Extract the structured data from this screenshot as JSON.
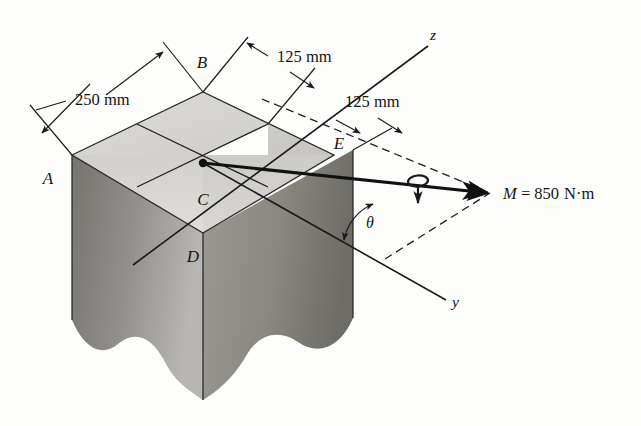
{
  "figure": {
    "type": "engineering-mechanics-diagram",
    "background_color": "#fdfdfc",
    "point_labels": [
      {
        "id": "A",
        "text": "A",
        "x": 48,
        "y": 184
      },
      {
        "id": "B",
        "text": "B",
        "x": 202,
        "y": 68
      },
      {
        "id": "C",
        "text": "C",
        "x": 203,
        "y": 205
      },
      {
        "id": "D",
        "text": "D",
        "x": 193,
        "y": 262
      },
      {
        "id": "E",
        "text": "E",
        "x": 339,
        "y": 149
      }
    ],
    "dimensions": [
      {
        "id": "dim-250",
        "text": "250 mm",
        "x": 75,
        "y": 105
      },
      {
        "id": "dim-125-upper",
        "text": "125 mm",
        "x": 277,
        "y": 62
      },
      {
        "id": "dim-125-lower",
        "text": "125 mm",
        "x": 345,
        "y": 107
      }
    ],
    "axes": [
      {
        "id": "z-axis",
        "label": "z",
        "x": 430,
        "y": 40
      },
      {
        "id": "y-axis",
        "label": "y",
        "x": 452,
        "y": 307
      }
    ],
    "angle": {
      "id": "theta",
      "label": "θ",
      "x": 366,
      "y": 228
    },
    "moment": {
      "id": "moment-vector",
      "symbol": "M",
      "equals": " = ",
      "value": "850",
      "unit": "N·m",
      "full_text": "M = 850 N·m",
      "label_x": 503,
      "label_y": 199,
      "rotation_sense": "counterclockwise-about-vector"
    },
    "colors": {
      "top_face_light": "#d8d6d2",
      "top_face_mid": "#c9c7c3",
      "left_face_dark": "#8f8d8a",
      "right_face_dark": "#8a8885",
      "line_color": "#1a1a1a",
      "background": "#fdfdfc"
    }
  }
}
